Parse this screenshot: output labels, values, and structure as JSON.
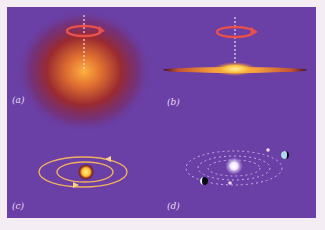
{
  "figure": {
    "panels": [
      {
        "id": "a",
        "label": "(a)",
        "description": "Rotating diffuse gas cloud"
      },
      {
        "id": "b",
        "label": "(b)",
        "description": "Cloud collapsed into flattened spinning disk"
      },
      {
        "id": "c",
        "label": "(c)",
        "description": "Star with orbiting rings/orbits"
      },
      {
        "id": "d",
        "label": "(d)",
        "description": "Central star with planets on dotted orbits"
      }
    ],
    "colors": {
      "background": "#6a3fa6",
      "page": "#f4eef4",
      "rotation_arrow": "#e8504a",
      "axis": "#f0e0f0",
      "core": "#ffd060",
      "orbit": "#f0b060"
    }
  }
}
